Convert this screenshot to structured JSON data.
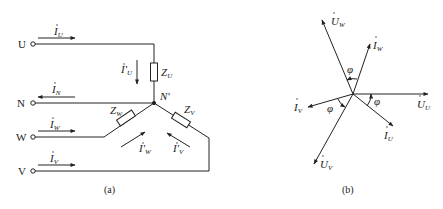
{
  "figure_a": {
    "caption": "(a)",
    "terminals": [
      {
        "id": "U",
        "label": "U",
        "current": "I",
        "current_sub": "U"
      },
      {
        "id": "N",
        "label": "N",
        "current": "I",
        "current_sub": "N"
      },
      {
        "id": "W",
        "label": "W",
        "current": "I",
        "current_sub": "W"
      },
      {
        "id": "V",
        "label": "V",
        "current": "I",
        "current_sub": "V"
      }
    ],
    "node_label": "N'",
    "impedances": [
      {
        "id": "ZU",
        "label": "Z",
        "sub": "U"
      },
      {
        "id": "ZW",
        "label": "Z",
        "sub": "W"
      },
      {
        "id": "ZV",
        "label": "Z",
        "sub": "V"
      }
    ],
    "phase_currents": [
      {
        "id": "IpU",
        "label": "I'",
        "sub": "U"
      },
      {
        "id": "IpW",
        "label": "I'",
        "sub": "W"
      },
      {
        "id": "IpV",
        "label": "I'",
        "sub": "V"
      }
    ]
  },
  "figure_b": {
    "caption": "(b)",
    "angle_symbol": "φ",
    "phasors": [
      {
        "id": "UU",
        "label": "U",
        "sub": "U",
        "angle_deg": 0
      },
      {
        "id": "IU",
        "label": "I",
        "sub": "U",
        "angle_deg": -40
      },
      {
        "id": "UW",
        "label": "U",
        "sub": "W",
        "angle_deg": 113
      },
      {
        "id": "IW",
        "label": "I",
        "sub": "W",
        "angle_deg": 73
      },
      {
        "id": "IV",
        "label": "I",
        "sub": "V",
        "angle_deg": 196
      },
      {
        "id": "UV",
        "label": "U",
        "sub": "V",
        "angle_deg": 244
      }
    ]
  }
}
